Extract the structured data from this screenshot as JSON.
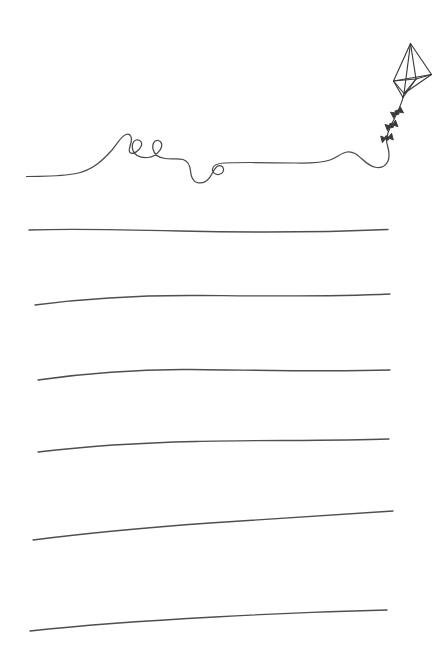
{
  "page": {
    "width": 440,
    "height": 654,
    "background_color": "#ffffff",
    "ink_color": "#4a4a4a",
    "rule_color": "#4f4f4f",
    "style": "hand-drawn line art"
  },
  "illustration": {
    "name": "kite-with-string",
    "description": "Hand drawn kite flying at upper right with a long curling string that sweeps to the left and doubles as the first writing line",
    "kite": {
      "name": "kite",
      "body_path": "M 410.5 43.5 L 393.5 81.0 L 404.0 93.5 L 431.5 74.5 Z",
      "spar_paths": [
        "M 410.5 43.5 L 404.0 93.5",
        "M 393.5 81.0 L 431.5 74.5",
        "M 410.5 43.5 L 416.0 79.0",
        "M 416.0 79.0 L 393.5 81.0",
        "M 416.0 79.0 L 431.5 74.5",
        "M 416.0 79.0 L 404.0 93.5"
      ],
      "bridle_paths": [
        "M 393.5 81.0 L 403.0 97.5",
        "M 404.0 93.5 L 403.0 97.5",
        "M 416.0 79.0 L 403.0 97.5"
      ]
    },
    "tail": {
      "name": "kite-tail",
      "path": "M 403.0 97.5 C 401.5 104.5 398.0 110.0 395.5 116.0 C 393.0 122.0 390.0 127.0 388.0 133.0 C 386.5 137.5 386.0 141.5 387.5 145.5",
      "bow_count": 3,
      "bows": [
        {
          "name": "tail-bow-1",
          "cx": 397.0,
          "cy": 112.5,
          "angle": -28
        },
        {
          "name": "tail-bow-2",
          "cx": 391.5,
          "cy": 125.5,
          "angle": -22
        },
        {
          "name": "tail-bow-3",
          "cx": 387.0,
          "cy": 138.0,
          "angle": -14
        }
      ]
    },
    "string": {
      "name": "kite-string",
      "loop_count": 3,
      "path": "M 26.5 176.5 C 45 176.0 62 176.5 76 173.5 C 93 170.0 103 160.0 112 150.0 C 118 143.0 121 136.0 126 134.5 C 131 133.0 132 138.0 131 142.5 C 130 147.5 128 150.5 130 152.5 C 133 155.0 139 151.0 141 146.5 C 143 142.5 140 139.0 136 140.0 C 132.5 141.0 131.5 146.0 133 150.5 C 135 156.0 141 158.0 148 157.5 C 153 157.0 157 154.0 160 150.0 C 163 146.0 162 141.0 158 140.5 C 154 140.0 152 144.5 153 149.0 C 154 154.0 158 157.5 165 158.5 C 172 159.5 178 158.0 183 159.5 C 188 161.0 190 166.0 190.5 171.0 C 191 176.5 192 181.0 197 182.5 C 202 184.0 207 181.0 210 177.0 C 213 173.0 214 168.5 217 166.5 C 220 164.5 223 166.0 223.5 169.0 C 224 172.0 221.5 174.5 218 174.5 C 214.5 174.5 212 172.0 212.5 169.0 C 213 165.5 217 163.5 224 163.0 C 240 162.0 268 162.5 296 163.0 C 312 163.3 322 163.0 330 160.0 C 337 157.5 341 153.0 347 152.0 C 353 151.0 357 154.5 362 159.0 C 367 163.5 371 167.0 377 167.5 C 382 168.0 386 165.5 388 161.0 C 390 156.5 389 151.0 387.5 145.5"
    }
  },
  "writing_lines": {
    "name": "writing-lines",
    "count": 6,
    "note": "hand-drawn ruled lines for writing; the kite string forms the topmost line",
    "lines": [
      {
        "name": "writing-line-1",
        "index": 1,
        "path": "M 29 230 C 70 228.5 120 229.5 180 231 C 245 232.5 320 232.5 388 229.5"
      },
      {
        "name": "writing-line-2",
        "index": 2,
        "path": "M 35 305 C 80 299 140 295 200 295.5 C 265 296 330 297 390 294"
      },
      {
        "name": "writing-line-3",
        "index": 3,
        "path": "M 38 380 C 80 374 130 369 190 369.5 C 255 370 325 372 390 370"
      },
      {
        "name": "writing-line-4",
        "index": 4,
        "path": "M 38 452 C 80 447 130 443 195 441.5 C 260 440 330 441 389 439"
      },
      {
        "name": "writing-line-5",
        "index": 5,
        "path": "M 33 540 C 80 534 140 528 210 523 C 280 518 340 514 393 511"
      },
      {
        "name": "writing-line-6",
        "index": 6,
        "path": "M 30 631 C 75 626 140 621 215 617 C 285 613 345 611 387 610"
      }
    ]
  }
}
